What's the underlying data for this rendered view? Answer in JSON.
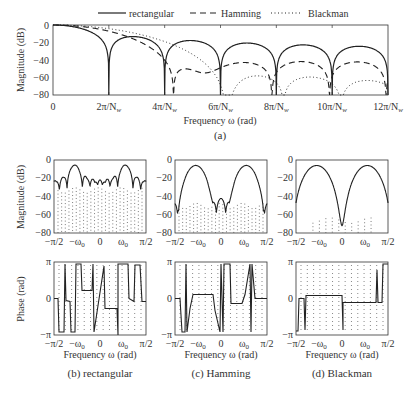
{
  "chart_data": [
    {
      "id": "a",
      "type": "line",
      "caption": "(a)",
      "title": "",
      "xlabel": "Frequency ω (rad)",
      "ylabel": "Magnitude (dB)",
      "ylim": [
        -80,
        0
      ],
      "yticks": [
        "0",
        "−20",
        "−40",
        "−60",
        "−80"
      ],
      "xticks": [
        "0",
        "2π/N_w",
        "4π/N_w",
        "6π/N_w",
        "8π/N_w",
        "10π/N_w",
        "12π/N_w"
      ],
      "legend": {
        "position": "top",
        "entries": [
          {
            "label": "rectangular",
            "style": "solid"
          },
          {
            "label": "Hamming",
            "style": "dashed"
          },
          {
            "label": "Blackman",
            "style": "dotted"
          }
        ]
      },
      "series": [
        {
          "name": "rectangular",
          "nulls_at_multiples_of": "2π/N_w",
          "sidelobe_peaks_db": [
            -13,
            -18,
            -21,
            -22,
            -23
          ]
        },
        {
          "name": "Hamming",
          "first_null": "4π/N_w",
          "sidelobe_peaks_db": [
            -43,
            -42,
            -41,
            -41
          ]
        },
        {
          "name": "Blackman",
          "first_null": "6π/N_w",
          "sidelobe_peaks_db": [
            -58,
            -58,
            -61
          ]
        }
      ],
      "grid": false
    },
    {
      "id": "b-mag",
      "type": "line",
      "ylabel": "Magnitude (dB)",
      "ylim": [
        -80,
        0
      ],
      "yticks": [
        "0",
        "−20",
        "−40",
        "−60",
        "−80"
      ],
      "xticks": [
        "−π/2",
        "−ω0",
        "0",
        "ω0",
        "π/2"
      ],
      "series": [
        {
          "name": "rectangular",
          "main_lobe_peaks_db": [
            -6,
            -6
          ],
          "sidelobes_db": -25
        }
      ]
    },
    {
      "id": "c-mag",
      "type": "line",
      "ylim": [
        -80,
        0
      ],
      "yticks": [
        "0",
        "−20",
        "−40",
        "−60",
        "−80"
      ],
      "xticks": [
        "−π/2",
        "−ω0",
        "0",
        "ω0",
        "π/2"
      ],
      "series": [
        {
          "name": "Hamming",
          "main_lobe_peaks_db": [
            -6,
            -6
          ],
          "sidelobes_db": -47
        }
      ]
    },
    {
      "id": "d-mag",
      "type": "line",
      "ylim": [
        -80,
        0
      ],
      "yticks": [
        "0",
        "−20",
        "−40",
        "−60",
        "−80"
      ],
      "xticks": [
        "−π/2",
        "−ω0",
        "0",
        "ω0",
        "π/2"
      ],
      "series": [
        {
          "name": "Blackman",
          "main_lobe_peaks_db": [
            -6,
            -6
          ],
          "sidelobes_db": -65
        }
      ]
    },
    {
      "id": "b-phase",
      "type": "line",
      "caption": "(b) rectangular",
      "xlabel": "Frequency ω (rad)",
      "ylabel": "Phase (rad)",
      "yticks": [
        "π",
        "0",
        "−π"
      ],
      "xticks": [
        "−π/2",
        "−ω0",
        "0",
        "ω0",
        "π/2"
      ]
    },
    {
      "id": "c-phase",
      "type": "line",
      "caption": "(c) Hamming",
      "xlabel": "Frequency ω (rad)",
      "yticks": [
        "π",
        "0",
        "−π"
      ],
      "xticks": [
        "−π/2",
        "−ω0",
        "0",
        "ω0",
        "π/2"
      ]
    },
    {
      "id": "d-phase",
      "type": "line",
      "caption": "(d) Blackman",
      "xlabel": "Frequency ω (rad)",
      "yticks": [
        "π",
        "0",
        "−π"
      ],
      "xticks": [
        "−π/2",
        "−ω0",
        "0",
        "ω0",
        "π/2"
      ]
    }
  ],
  "labels": {
    "legend_rect": "rectangular",
    "legend_hamm": "Hamming",
    "legend_black": "Blackman",
    "top_xlabel": "Frequency ω (rad)",
    "top_caption": "(a)",
    "ylabel_mag": "Magnitude (dB)",
    "ylabel_phase": "Phase (rad)",
    "xlabel_freq": "Frequency ω (rad)",
    "cap_b": "(b) rectangular",
    "cap_c": "(c) Hamming",
    "cap_d": "(d) Blackman",
    "ytick_mag": [
      "0",
      "−20",
      "−40",
      "−60",
      "−80"
    ],
    "ytick_phase": [
      "π",
      "0",
      "−π"
    ],
    "xtick_top": [
      "0",
      "2π/N",
      "4π/N",
      "6π/N",
      "8π/N",
      "10π/N",
      "12π/N"
    ],
    "xtick_sub": "w",
    "xtick_small": [
      "−π/2",
      "−ω",
      "0",
      "ω",
      "π/2"
    ],
    "omega_sub": "0"
  }
}
